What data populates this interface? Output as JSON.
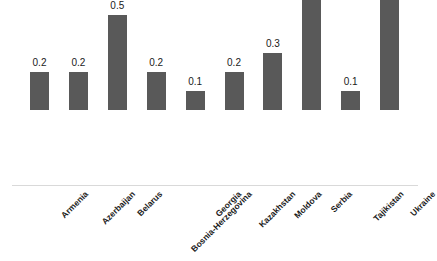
{
  "chart_data": {
    "type": "bar",
    "title": "",
    "subtitle": "",
    "xlabel": "",
    "ylabel": "",
    "ylim": [
      0,
      0.9
    ],
    "grid": false,
    "legend": false,
    "legend_position": "none",
    "bar_color": "#595959",
    "axis_color": "#d9d9d9",
    "background": "#ffffff",
    "categories": [
      "Armenia",
      "Azerbaijan",
      "Belarus",
      "Bosnia-Herzegovina",
      "Georgia",
      "Kazakhstan",
      "Moldova",
      "Serbia",
      "Tajikistan",
      "Ukraine"
    ],
    "values": [
      0.2,
      0.2,
      0.5,
      0.2,
      0.1,
      0.2,
      0.3,
      0.8,
      0.1,
      0.6
    ],
    "data_labels": [
      "0.2",
      "0.2",
      "0.5",
      "0.2",
      "0.1",
      "0.2",
      "0.3",
      "0.8",
      "0.1",
      "0.6"
    ],
    "tick_labels": [],
    "annotations": []
  }
}
